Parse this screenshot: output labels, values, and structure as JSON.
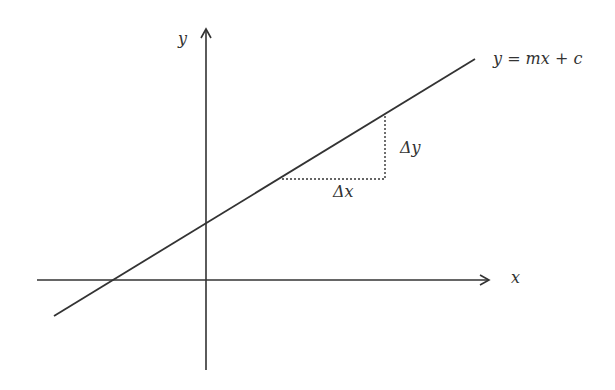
{
  "diagram": {
    "labels": {
      "y_axis": "y",
      "x_axis": "x",
      "equation": "y = mx + c",
      "delta_x": "Δx",
      "delta_y": "Δy"
    },
    "colors": {
      "stroke": "#333333",
      "background": "#ffffff"
    }
  }
}
